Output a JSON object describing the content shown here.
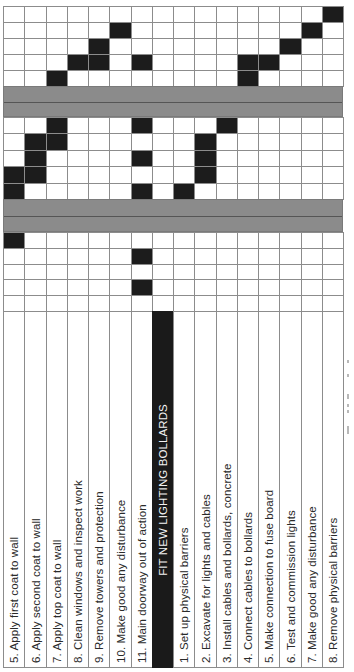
{
  "figure": {
    "orientation": "rotated-90-ccw",
    "colors": {
      "filled_cell": "#1c1c1c",
      "grid_line": "#8c8c8c",
      "section_band": "#8b8b8b",
      "header_bg": "#1a1a1a",
      "header_text": "#f2f2f2",
      "text": "#2a2a2a"
    },
    "grid": {
      "left": 3,
      "col_width": 21.25,
      "label_top": 311,
      "label_bottom": 668,
      "row_blocks": [
        {
          "top": 6,
          "rows": 5,
          "row_height": 16
        },
        {
          "top": 117,
          "rows": 5,
          "row_height": 16.4
        },
        {
          "top": 232,
          "rows": 5,
          "row_height": 15.8
        }
      ],
      "bands": [
        {
          "top": 86,
          "height": 31,
          "midline": 15
        },
        {
          "top": 199,
          "height": 33,
          "midline": 16
        }
      ]
    },
    "tasks": [
      {
        "label": "5. Apply first coat to wall",
        "header": false
      },
      {
        "label": "6. Apply second coat to wall",
        "header": false
      },
      {
        "label": "7. Apply top coat to wall",
        "header": false
      },
      {
        "label": "8. Clean windows and inspect work",
        "header": false
      },
      {
        "label": "9. Remove towers and protection",
        "header": false
      },
      {
        "label": "10. Make good any disturbance",
        "header": false
      },
      {
        "label": "11. Main doorway out of action",
        "header": false
      },
      {
        "label": "FIT NEW LIGHTING BOLLARDS",
        "header": true
      },
      {
        "label": "1. Set up physical barriers",
        "header": false
      },
      {
        "label": "2. Excavate for lights and cables",
        "header": false
      },
      {
        "label": "3. Install cables and bollards, concrete",
        "header": false
      },
      {
        "label": "4. Connect cables to bollards",
        "header": false
      },
      {
        "label": "5. Make connection to fuse board",
        "header": false
      },
      {
        "label": "6. Test and commission lights",
        "header": false
      },
      {
        "label": "7. Make good any disturbance",
        "header": false
      },
      {
        "label": "8. Remove physical barriers",
        "header": false
      }
    ],
    "filled": [
      [
        [
          15
        ],
        [
          5,
          14
        ],
        [
          4,
          13
        ],
        [
          3,
          4,
          6,
          11,
          12
        ],
        [
          2,
          11
        ]
      ],
      [
        [
          2,
          6,
          10
        ],
        [
          1,
          2,
          9
        ],
        [
          1,
          6,
          9
        ],
        [
          0,
          1,
          9
        ],
        [
          0,
          6,
          8
        ]
      ],
      [
        [
          0
        ],
        [
          6
        ],
        [],
        [
          6
        ],
        []
      ]
    ]
  }
}
